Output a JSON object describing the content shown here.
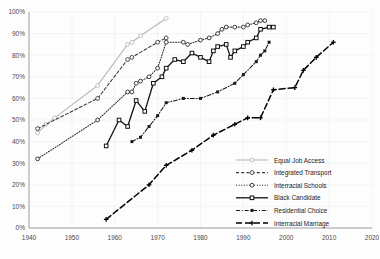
{
  "chart_data": {
    "type": "line",
    "title": "",
    "xlabel": "",
    "ylabel": "",
    "xlim": [
      1940,
      2020
    ],
    "ylim": [
      0,
      100
    ],
    "grid": true,
    "legend_position": "bottom-right",
    "xticks": [
      "1940",
      "1950",
      "1960",
      "1970",
      "1980",
      "1990",
      "2000",
      "2010",
      "2020"
    ],
    "yticks": [
      "0%",
      "10%",
      "20%",
      "30%",
      "40%",
      "50%",
      "60%",
      "70%",
      "80%",
      "90%",
      "100%"
    ],
    "series": [
      {
        "name": "Equal Job Access",
        "color": "#b9b9b9",
        "style": "solid-light",
        "marker": "circle-open",
        "x": [
          1942,
          1944,
          1946,
          1956,
          1963,
          1964,
          1966,
          1972
        ],
        "values": [
          44,
          48,
          51,
          66,
          85,
          86,
          89,
          97
        ]
      },
      {
        "name": "Integrated Transport",
        "color": "#3a3a3a",
        "style": "dashed",
        "marker": "circle-open",
        "x": [
          1942,
          1956,
          1963,
          1964,
          1970,
          1972
        ],
        "values": [
          46,
          60,
          78,
          79,
          86,
          88
        ]
      },
      {
        "name": "Interracial Schools",
        "color": "#2a2a2a",
        "style": "dotted",
        "marker": "circle-open",
        "x": [
          1942,
          1956,
          1963,
          1964,
          1965,
          1966,
          1968,
          1970,
          1972,
          1976,
          1977,
          1980,
          1982,
          1984,
          1985,
          1986,
          1988,
          1990,
          1991,
          1993,
          1994,
          1995
        ],
        "values": [
          32,
          50,
          63,
          63,
          67,
          68,
          70,
          74,
          86,
          86,
          85,
          87,
          88,
          90,
          92,
          93,
          93,
          93,
          94,
          95,
          96,
          96
        ]
      },
      {
        "name": "Black Candidate",
        "color": "#111111",
        "style": "solid",
        "marker": "square",
        "x": [
          1958,
          1961,
          1963,
          1965,
          1967,
          1969,
          1971,
          1972,
          1974,
          1976,
          1978,
          1980,
          1982,
          1983,
          1984,
          1986,
          1987,
          1988,
          1990,
          1991,
          1993,
          1994,
          1996,
          1997
        ],
        "values": [
          38,
          50,
          47,
          59,
          54,
          67,
          70,
          74,
          78,
          77,
          81,
          79,
          77,
          82,
          84,
          85,
          79,
          82,
          84,
          86,
          88,
          92,
          93,
          93
        ]
      },
      {
        "name": "Residential Choice",
        "color": "#1a1a1a",
        "style": "dash-dot",
        "marker": "square-small",
        "x": [
          1964,
          1966,
          1968,
          1970,
          1972,
          1976,
          1980,
          1984,
          1988,
          1990,
          1993,
          1994,
          1995,
          1996
        ],
        "values": [
          40,
          42,
          47,
          52,
          58,
          60,
          60,
          63,
          67,
          71,
          77,
          80,
          82,
          86
        ]
      },
      {
        "name": "Interracial Marriage",
        "color": "#000000",
        "style": "long-dash",
        "marker": "plus",
        "x": [
          1958,
          1968,
          1972,
          1978,
          1983,
          1988,
          1991,
          1994,
          1997,
          2002,
          2004,
          2007,
          2011
        ],
        "values": [
          4,
          20,
          29,
          36,
          43,
          48,
          51,
          51,
          64,
          65,
          73,
          79,
          86
        ]
      }
    ]
  },
  "legend": {
    "items": [
      {
        "label": "Equal Job Access"
      },
      {
        "label": "Integrated Transport"
      },
      {
        "label": "Interracial Schools"
      },
      {
        "label": "Black Candidate"
      },
      {
        "label": "Residential Choice"
      },
      {
        "label": "Interracial Marriage"
      }
    ]
  }
}
